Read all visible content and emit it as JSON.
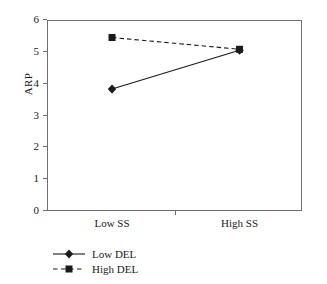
{
  "chart_data": {
    "type": "line",
    "title": "",
    "xlabel": "",
    "ylabel": "ARP",
    "categories": [
      "Low SS",
      "High SS"
    ],
    "ylim": [
      0,
      6
    ],
    "yticks": [
      0,
      1,
      2,
      3,
      4,
      5,
      6
    ],
    "ytick_labels": [
      "0",
      "1",
      "2",
      "3",
      "4",
      "5",
      "6"
    ],
    "grid": false,
    "legend_position": "below-left",
    "series": [
      {
        "name": "Low DEL",
        "values": [
          3.83,
          5.05
        ],
        "marker": "diamond",
        "linestyle": "solid",
        "color": "#1a1a1a"
      },
      {
        "name": "High DEL",
        "values": [
          5.45,
          5.08
        ],
        "marker": "square",
        "linestyle": "dashed",
        "color": "#1a1a1a"
      }
    ]
  },
  "legend": {
    "items": [
      {
        "label": "Low DEL",
        "marker": "diamond-marker-icon",
        "linestyle": "solid"
      },
      {
        "label": "High DEL",
        "marker": "square-marker-icon",
        "linestyle": "dashed"
      }
    ]
  },
  "colors": {
    "axis": "#6f6f6f",
    "series": "#1a1a1a",
    "background": "#ffffff"
  }
}
